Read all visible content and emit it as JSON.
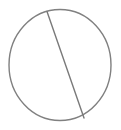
{
  "figure": {
    "name": "circle-with-chord-diagram",
    "canvas": {
      "width": 121,
      "height": 130,
      "background_color": "#ffffff"
    },
    "style": {
      "stroke_color": "#808080",
      "chord_stroke_color": "#7a7a7a",
      "stroke_width": 1.4,
      "chord_stroke_width": 1.4,
      "fill": "none"
    },
    "shapes": [
      {
        "id": "circle-outline",
        "type": "ellipse",
        "label": "circle",
        "center_x": 60,
        "center_y": 65,
        "radius_x": 51,
        "radius_y": 55.5,
        "stroke_color": "#808080",
        "stroke_width": 1.4,
        "fill": "none"
      },
      {
        "id": "chord-line",
        "type": "line",
        "label": "chord",
        "x1": 47,
        "y1": 11.5,
        "x2": 84,
        "y2": 118,
        "stroke_color": "#7a7a7a",
        "stroke_width": 1.4
      }
    ],
    "labels": [],
    "annotations": []
  }
}
